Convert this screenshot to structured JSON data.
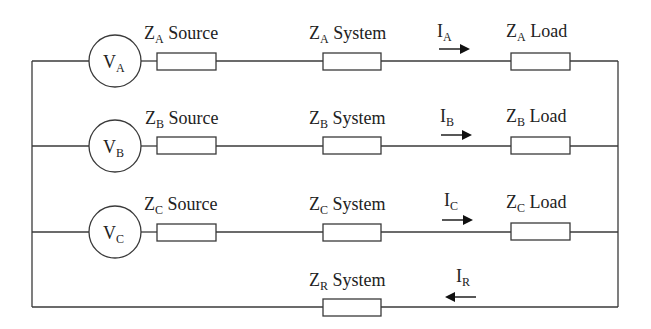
{
  "diagram": {
    "type": "three-phase circuit with return path",
    "colors": {
      "line": "#3a3a3a",
      "text": "#222222",
      "background": "#ffffff"
    },
    "phases": [
      {
        "id": "A",
        "source": {
          "symbol": "V",
          "sub": "A"
        },
        "source_impedance": {
          "symbol": "Z",
          "sub": "A",
          "label": "Source"
        },
        "system_impedance": {
          "symbol": "Z",
          "sub": "A",
          "label": "System"
        },
        "current": {
          "symbol": "I",
          "sub": "A",
          "direction": "right"
        },
        "load_impedance": {
          "symbol": "Z",
          "sub": "A",
          "label": "Load"
        }
      },
      {
        "id": "B",
        "source": {
          "symbol": "V",
          "sub": "B"
        },
        "source_impedance": {
          "symbol": "Z",
          "sub": "B",
          "label": "Source"
        },
        "system_impedance": {
          "symbol": "Z",
          "sub": "B",
          "label": "System"
        },
        "current": {
          "symbol": "I",
          "sub": "B",
          "direction": "right"
        },
        "load_impedance": {
          "symbol": "Z",
          "sub": "B",
          "label": "Load"
        }
      },
      {
        "id": "C",
        "source": {
          "symbol": "V",
          "sub": "C"
        },
        "source_impedance": {
          "symbol": "Z",
          "sub": "C",
          "label": "Source"
        },
        "system_impedance": {
          "symbol": "Z",
          "sub": "C",
          "label": "System"
        },
        "current": {
          "symbol": "I",
          "sub": "C",
          "direction": "right"
        },
        "load_impedance": {
          "symbol": "Z",
          "sub": "C",
          "label": "Load"
        }
      }
    ],
    "return_path": {
      "system_impedance": {
        "symbol": "Z",
        "sub": "R",
        "label": "System"
      },
      "current": {
        "symbol": "I",
        "sub": "R",
        "direction": "left"
      }
    }
  }
}
